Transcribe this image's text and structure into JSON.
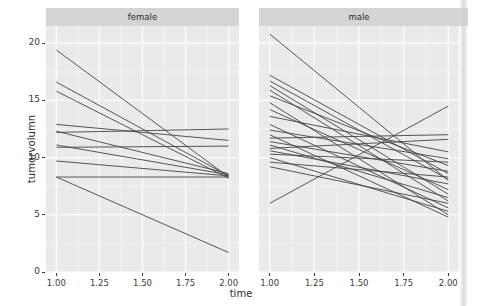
{
  "chart_data": {
    "type": "line",
    "title": "",
    "subtitle": "",
    "xlabel": "time",
    "ylabel": "tumorvolumn",
    "xlim": [
      0.94,
      2.06
    ],
    "ylim": [
      0,
      21.5
    ],
    "x_ticks": [
      1.0,
      1.25,
      1.5,
      1.75,
      2.0
    ],
    "x_tick_labels": [
      "1.00",
      "1.25",
      "1.50",
      "1.75",
      "2.00"
    ],
    "y_ticks": [
      0,
      5,
      10,
      15,
      20
    ],
    "y_tick_labels": [
      "0",
      "5",
      "10",
      "15",
      "20"
    ],
    "grid": true,
    "grid_major_color": "#ffffff",
    "grid_minor_color": "#f5f5f5",
    "panel_background": "#eaeaea",
    "strip_background": "#d4d4d4",
    "line_color": "#444444",
    "legend_position": "none",
    "facet_variable": "sex",
    "facets": [
      {
        "label": "female",
        "x": [
          1.0,
          2.0
        ],
        "series": [
          {
            "name": "f01",
            "values": [
              19.4,
              8.3
            ]
          },
          {
            "name": "f02",
            "values": [
              16.6,
              8.4
            ]
          },
          {
            "name": "f03",
            "values": [
              15.8,
              8.2
            ]
          },
          {
            "name": "f04",
            "values": [
              12.9,
              11.5
            ]
          },
          {
            "name": "f05",
            "values": [
              12.3,
              8.6
            ]
          },
          {
            "name": "f06",
            "values": [
              12.2,
              12.5
            ]
          },
          {
            "name": "f07",
            "values": [
              11.1,
              8.5
            ]
          },
          {
            "name": "f08",
            "values": [
              10.9,
              11.0
            ]
          },
          {
            "name": "f09",
            "values": [
              9.7,
              8.4
            ]
          },
          {
            "name": "f10",
            "values": [
              8.3,
              8.3
            ]
          },
          {
            "name": "f11",
            "values": [
              8.3,
              1.7
            ]
          }
        ]
      },
      {
        "label": "male",
        "x": [
          1.0,
          2.0
        ],
        "series": [
          {
            "name": "m01",
            "values": [
              20.8,
              8.0
            ]
          },
          {
            "name": "m02",
            "values": [
              17.2,
              8.6
            ]
          },
          {
            "name": "m03",
            "values": [
              16.7,
              8.1
            ]
          },
          {
            "name": "m04",
            "values": [
              16.3,
              6.8
            ]
          },
          {
            "name": "m05",
            "values": [
              15.9,
              6.2
            ]
          },
          {
            "name": "m06",
            "values": [
              15.4,
              9.3
            ]
          },
          {
            "name": "m07",
            "values": [
              14.8,
              5.0
            ]
          },
          {
            "name": "m08",
            "values": [
              14.2,
              7.2
            ]
          },
          {
            "name": "m09",
            "values": [
              13.6,
              10.5
            ]
          },
          {
            "name": "m10",
            "values": [
              12.9,
              5.6
            ]
          },
          {
            "name": "m11",
            "values": [
              12.4,
              9.9
            ]
          },
          {
            "name": "m12",
            "values": [
              12.0,
              4.8
            ]
          },
          {
            "name": "m13",
            "values": [
              11.7,
              12.0
            ]
          },
          {
            "name": "m14",
            "values": [
              11.4,
              8.8
            ]
          },
          {
            "name": "m15",
            "values": [
              11.1,
              6.5
            ]
          },
          {
            "name": "m16",
            "values": [
              10.8,
              11.6
            ]
          },
          {
            "name": "m17",
            "values": [
              10.6,
              7.7
            ]
          },
          {
            "name": "m18",
            "values": [
              10.3,
              9.6
            ]
          },
          {
            "name": "m19",
            "values": [
              10.0,
              5.3
            ]
          },
          {
            "name": "m20",
            "values": [
              9.6,
              8.3
            ]
          },
          {
            "name": "m21",
            "values": [
              9.2,
              6.0
            ]
          },
          {
            "name": "m22",
            "values": [
              6.0,
              14.5
            ]
          }
        ]
      }
    ]
  },
  "axis": {
    "y_title": "tumorvolumn",
    "x_title": "time"
  }
}
